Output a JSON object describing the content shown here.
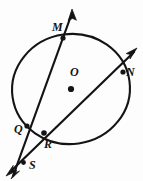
{
  "figure": {
    "kind": "geometry-diagram",
    "background_color": "#fdfdfd",
    "ink_color": "#141414",
    "width": 143,
    "height": 181
  },
  "circle": {
    "name": "circle-O",
    "center_label": "O",
    "center_x": 71,
    "center_y": 89,
    "radius_x": 59,
    "radius_y": 55,
    "rotation_deg": -8,
    "stroke_width": 2.1
  },
  "points": [
    {
      "id": "M",
      "label": "M",
      "x": 63,
      "y": 38,
      "role": "circle-intersection",
      "has_dot": true
    },
    {
      "id": "N",
      "label": "N",
      "x": 123,
      "y": 72,
      "role": "circle-intersection",
      "has_dot": true
    },
    {
      "id": "O",
      "label": "O",
      "x": 71,
      "y": 89,
      "role": "center",
      "has_dot": true
    },
    {
      "id": "Q",
      "label": "Q",
      "x": 27,
      "y": 126,
      "role": "circle-intersection",
      "has_dot": true
    },
    {
      "id": "R",
      "label": "R",
      "x": 44,
      "y": 133,
      "role": "circle-intersection",
      "has_dot": true
    },
    {
      "id": "S",
      "label": "S",
      "x": 24,
      "y": 163,
      "role": "external-intersection",
      "has_dot": true
    }
  ],
  "lines": [
    {
      "id": "line-MQS",
      "name": "secant-ray-m-q-s",
      "through": [
        "M",
        "Q",
        "S"
      ],
      "x1": 72,
      "y1": 11,
      "x2": 12,
      "y2": 178,
      "arrow_at_start": true,
      "arrow_at_end": true
    },
    {
      "id": "line-NRS",
      "name": "secant-ray-n-r-s",
      "through": [
        "N",
        "R",
        "S"
      ],
      "x1": 136,
      "y1": 50,
      "x2": 8,
      "y2": 174,
      "arrow_at_start": true,
      "arrow_at_end": true
    }
  ],
  "labels": {
    "M": "M",
    "N": "N",
    "O": "O",
    "Q": "Q",
    "R": "R",
    "S": "S"
  }
}
